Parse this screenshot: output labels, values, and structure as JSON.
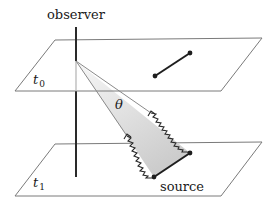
{
  "figure": {
    "labels": {
      "observer": "observer",
      "source": "source",
      "t0_main": "t",
      "t0_sub": "0",
      "t1_main": "t",
      "t1_sub": "1",
      "theta": "θ"
    },
    "colors": {
      "plane_edge": "#7a7a7a",
      "worldline": "#2a2a2a",
      "worldline_hidden": "#bdbdbd",
      "ray": "#8a8a8a",
      "cone_fill_top": "#f5f5f5",
      "cone_fill_bottom": "#cfcfcf",
      "segment": "#1e1e1e",
      "photon": "#2a2a2a"
    },
    "planes": [
      {
        "name": "t0",
        "points": [
          [
            55,
            40
          ],
          [
            262,
            38
          ],
          [
            221,
            91
          ],
          [
            15,
            91
          ]
        ]
      },
      {
        "name": "t1",
        "points": [
          [
            55,
            144
          ],
          [
            262,
            142
          ],
          [
            221,
            196
          ],
          [
            15,
            196
          ]
        ]
      }
    ],
    "observer_line": {
      "x": 76,
      "y_top": 27,
      "event_y": 61,
      "plane_t0_front_y": 91,
      "y_bottom": 177
    },
    "segment_t0": {
      "from": [
        155,
        76
      ],
      "to": [
        190,
        53
      ]
    },
    "segment_source": {
      "from": [
        154,
        177
      ],
      "to": [
        190,
        153
      ]
    },
    "cone_apex": [
      76,
      61
    ]
  }
}
